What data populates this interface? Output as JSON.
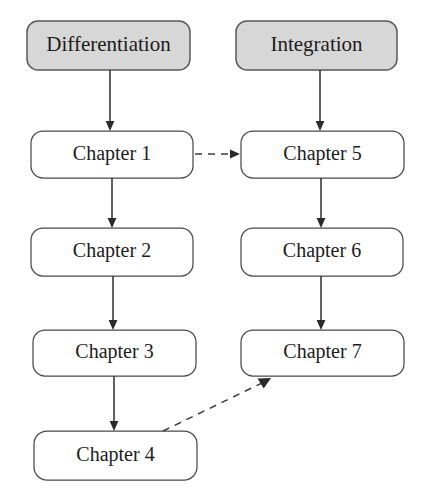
{
  "diagram": {
    "type": "flowchart",
    "title": "",
    "orientation": "two-column top-down",
    "columns": [
      {
        "id": "left",
        "header": "Differentiation"
      },
      {
        "id": "right",
        "header": "Integration"
      }
    ],
    "headers": [
      {
        "id": "differentiation",
        "label": "Differentiation",
        "style": "filled",
        "fill": "#d7d7d7",
        "stroke": "#5a5a5a",
        "x": 27,
        "y": 21,
        "w": 163,
        "h": 49
      },
      {
        "id": "integration",
        "label": "Integration",
        "style": "filled",
        "fill": "#d7d7d7",
        "stroke": "#5a5a5a",
        "x": 236,
        "y": 21,
        "w": 161,
        "h": 49
      }
    ],
    "nodes": [
      {
        "id": "ch1",
        "label": "Chapter 1",
        "column": "left",
        "x": 31,
        "y": 131,
        "w": 162,
        "h": 47
      },
      {
        "id": "ch2",
        "label": "Chapter 2",
        "column": "left",
        "x": 31,
        "y": 228,
        "w": 162,
        "h": 48
      },
      {
        "id": "ch3",
        "label": "Chapter 3",
        "column": "left",
        "x": 33,
        "y": 330,
        "w": 163,
        "h": 46
      },
      {
        "id": "ch4",
        "label": "Chapter 4",
        "column": "left",
        "x": 34,
        "y": 431,
        "w": 163,
        "h": 49
      },
      {
        "id": "ch5",
        "label": "Chapter 5",
        "column": "right",
        "x": 241,
        "y": 131,
        "w": 163,
        "h": 47
      },
      {
        "id": "ch6",
        "label": "Chapter 6",
        "column": "right",
        "x": 241,
        "y": 228,
        "w": 162,
        "h": 48
      },
      {
        "id": "ch7",
        "label": "Chapter 7",
        "column": "right",
        "x": 241,
        "y": 330,
        "w": 163,
        "h": 46
      }
    ],
    "edges": [
      {
        "id": "e-diff-ch1",
        "from": "differentiation",
        "to": "ch1",
        "style": "solid",
        "arrow": true
      },
      {
        "id": "e-ch1-ch2",
        "from": "ch1",
        "to": "ch2",
        "style": "solid",
        "arrow": true
      },
      {
        "id": "e-ch2-ch3",
        "from": "ch2",
        "to": "ch3",
        "style": "solid",
        "arrow": true
      },
      {
        "id": "e-ch3-ch4",
        "from": "ch3",
        "to": "ch4",
        "style": "solid",
        "arrow": true
      },
      {
        "id": "e-int-ch5",
        "from": "integration",
        "to": "ch5",
        "style": "solid",
        "arrow": true
      },
      {
        "id": "e-ch5-ch6",
        "from": "ch5",
        "to": "ch6",
        "style": "solid",
        "arrow": true
      },
      {
        "id": "e-ch6-ch7",
        "from": "ch6",
        "to": "ch7",
        "style": "solid",
        "arrow": true
      },
      {
        "id": "e-ch1-ch5",
        "from": "ch1",
        "to": "ch5",
        "style": "dashed",
        "arrow": true
      },
      {
        "id": "e-ch4-ch7",
        "from": "ch4",
        "to": "ch7",
        "style": "dashed",
        "arrow": true
      }
    ],
    "colors": {
      "header_fill": "#d7d7d7",
      "node_fill": "#ffffff",
      "stroke": "#3a3a3a",
      "text": "#1c1c1c",
      "background": "#ffffff"
    }
  }
}
